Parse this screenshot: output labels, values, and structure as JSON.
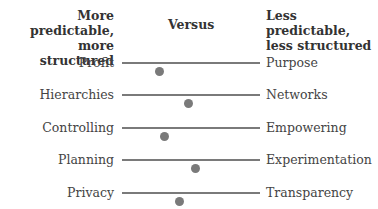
{
  "header": {
    "left_line1": "More predictable,",
    "left_line2": "more structured",
    "middle": "Versus",
    "right_line1": "Less predictable,",
    "right_line2": "less structured"
  },
  "rows": [
    {
      "left": "Profit",
      "right": "Purpose",
      "position_pct": 27
    },
    {
      "left": "Hierarchies",
      "right": "Networks",
      "position_pct": 48
    },
    {
      "left": "Controlling",
      "right": "Empowering",
      "position_pct": 31
    },
    {
      "left": "Planning",
      "right": "Experimentation",
      "position_pct": 53
    },
    {
      "left": "Privacy",
      "right": "Transparency",
      "position_pct": 42
    }
  ],
  "colors": {
    "track": "#7a7a7a",
    "text": "#444444"
  }
}
